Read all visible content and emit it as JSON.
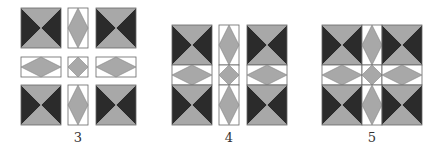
{
  "figures": [
    {
      "label": "3",
      "description": "Separated tiles: 4 hourglass squares, 4 diamond rectangles, center diamond"
    },
    {
      "label": "4",
      "description": "Tiles joined into vertical columns"
    },
    {
      "label": "5",
      "description": "All tiles joined into a full quilt block"
    }
  ],
  "colors": {
    "dark": "#2b2b2b",
    "light": "#a8a8a8",
    "outline": "#666666",
    "background": "#ffffff"
  }
}
